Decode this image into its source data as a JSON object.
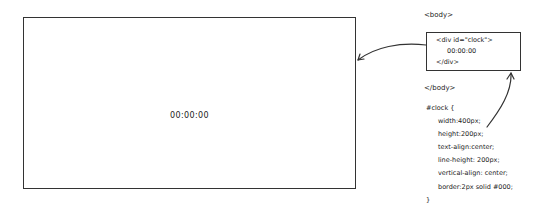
{
  "clock_preview": {
    "display": "00:00:00"
  },
  "html_snippet": {
    "body_open": "<body>",
    "div_open": "<div id=\"clock\">",
    "div_content": "00:00:00",
    "div_close": "</div>",
    "body_close": "</body>"
  },
  "css_snippet": {
    "selector": "#clock {",
    "rules": [
      "width:400px;",
      "height:200px;",
      "text-align:center;",
      "line-height: 200px;",
      "vertical-align: center;",
      "border:2px solid #000;"
    ],
    "close": "}"
  },
  "colors": {
    "stroke": "#333333",
    "background": "#ffffff"
  }
}
